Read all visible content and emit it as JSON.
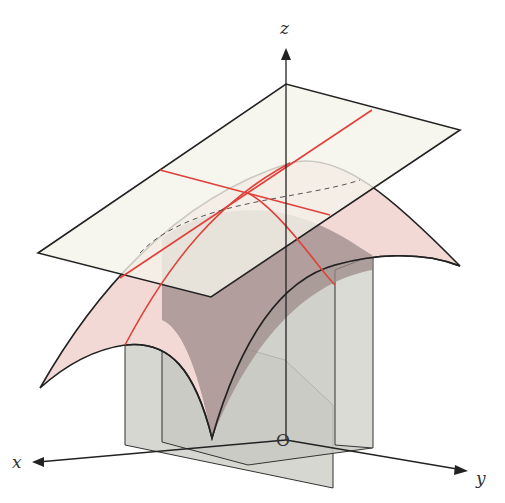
{
  "diagram": {
    "type": "3d-surface-with-tangent-plane",
    "axes": {
      "x_label": "x",
      "y_label": "y",
      "z_label": "z",
      "origin_label": "O"
    },
    "colors": {
      "surface_fill": "#f2d9d6",
      "surface_shadow": "#9c8a88",
      "tangent_plane_fill": "#f4f2ea",
      "vertical_plane_fill": "#c9cbc4",
      "curve_red": "#e0413a",
      "outline": "#222222"
    }
  }
}
